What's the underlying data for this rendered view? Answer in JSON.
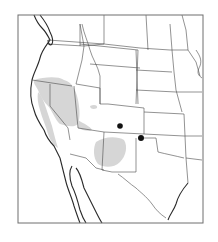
{
  "map": {
    "type": "range-map",
    "region": "western-united-states",
    "colors": {
      "background": "#ffffff",
      "frame": "#6e6e6e",
      "coastline": "#2a2a2a",
      "state_borders": "#4a4a4a",
      "range_fill": "#d6d6d6",
      "point_marker": "#111111"
    },
    "frame": {
      "x": 18,
      "y": 15,
      "width": 185,
      "height": 208
    },
    "range_areas": [
      {
        "name": "great-basin-california-range",
        "path": "M34,80 C44,77 58,76 64,80 C72,82 76,90 78,100 C80,110 80,118 78,124 C74,128 66,126 60,124 C55,120 52,110 48,106 C44,102 40,96 38,90 C36,86 33,83 34,80 Z"
      },
      {
        "name": "utah-nevada-range-tail",
        "path": "M78,120 C84,124 90,126 92,130 C88,132 82,130 78,128 Z"
      },
      {
        "name": "utah-patch",
        "path": "M90,106 C94,104 98,105 97,108 C94,110 90,109 90,106 Z"
      },
      {
        "name": "arizona-new-mexico-range",
        "path": "M96,142 C104,136 118,136 124,140 C128,146 126,156 120,162 C114,168 104,168 98,164 C93,158 93,148 96,142 Z"
      },
      {
        "name": "california-coast-range",
        "path": "M38,92 C42,96 44,102 46,108 C48,114 50,120 52,126 C54,134 56,142 58,148 C54,146 50,140 48,134 C46,126 42,118 40,110 C38,104 37,98 38,92 Z"
      }
    ],
    "point_records": [
      {
        "name": "colorado-record",
        "x": 120,
        "y": 126,
        "r": 2.8
      },
      {
        "name": "oklahoma-panhandle-record",
        "x": 141,
        "y": 138,
        "r": 3
      }
    ],
    "coastlines": [
      {
        "name": "pacific-coast",
        "path": "M34,15 C36,20 38,24 42,28 C46,32 48,36 50,40 C46,46 42,50 40,58 C38,66 34,72 32,80 C30,90 30,100 34,110 C36,118 40,124 44,130 C46,136 50,142 54,146 C56,150 58,154 60,158"
      },
      {
        "name": "puget-sound",
        "path": "M40,15 C44,20 48,26 50,32 C52,36 54,40 52,44 C50,46 48,44 48,40"
      },
      {
        "name": "baja-outer-coast",
        "path": "M60,158 C62,166 64,174 66,182 C68,190 72,198 74,206 C76,212 78,218 80,223"
      },
      {
        "name": "baja-gulf-coast",
        "path": "M72,166 C68,172 70,180 72,186 C76,194 78,202 80,210 C82,216 84,220 86,223"
      },
      {
        "name": "mainland-gulf-coast",
        "path": "M76,168 C80,172 82,180 84,188 C88,196 92,204 96,212 C98,216 100,220 102,223"
      },
      {
        "name": "texas-gulf-coast",
        "path": "M188,183 C182,190 178,196 176,204 C174,210 170,214 168,220"
      }
    ],
    "state_borders": [
      {
        "name": "washington-oregon",
        "path": "M48,44 L84,46 L104,44"
      },
      {
        "name": "oregon-california-nevada",
        "path": "M32,80 L72,86"
      },
      {
        "name": "california-nevada",
        "path": "M50,84 L50,106 L68,128 L70,140"
      },
      {
        "name": "nevada-utah",
        "path": "M74,86 L78,128"
      },
      {
        "name": "idaho-west",
        "path": "M80,24 L84,46 L82,60 L76,84"
      },
      {
        "name": "idaho-montana",
        "path": "M82,24 C84,34 88,42 90,50 C92,58 98,66 100,76"
      },
      {
        "name": "montana-north",
        "path": "M80,44 L138,50"
      },
      {
        "name": "montana-wyoming",
        "path": "M90,64 L140,68"
      },
      {
        "name": "idaho-utah-wyoming",
        "path": "M76,84 L100,88 L100,104"
      },
      {
        "name": "wyoming-east",
        "path": "M138,50 L136,104"
      },
      {
        "name": "wyoming-colorado-utah",
        "path": "M100,76 L100,104 L108,104 L144,108"
      },
      {
        "name": "utah-arizona",
        "path": "M78,128 L104,132 L144,134"
      },
      {
        "name": "colorado-east",
        "path": "M144,108 L144,134"
      },
      {
        "name": "arizona-new-mexico",
        "path": "M104,132 L102,170"
      },
      {
        "name": "new-mexico-texas",
        "path": "M102,170 L112,172 L136,172 L136,138"
      },
      {
        "name": "mexico-border-west",
        "path": "M70,154 L86,158 L96,168 L104,170"
      },
      {
        "name": "texas-mexico-border",
        "path": "M118,174 C124,178 130,184 136,188 C140,192 146,196 152,204 C156,210 160,214 166,218"
      },
      {
        "name": "dakotas-west",
        "path": "M136,50 L138,104"
      },
      {
        "name": "north-south-dakota",
        "path": "M136,70 L172,72"
      },
      {
        "name": "south-dakota-nebraska",
        "path": "M136,90 L176,92"
      },
      {
        "name": "nebraska-kansas",
        "path": "M144,112 L184,114"
      },
      {
        "name": "kansas-oklahoma",
        "path": "M144,134 L184,136"
      },
      {
        "name": "oklahoma-texas",
        "path": "M144,138 L156,138 L158,152 C166,154 176,156 184,158"
      },
      {
        "name": "dakotas-minnesota",
        "path": "M170,24 L172,50 L174,72 L176,90 L182,112"
      },
      {
        "name": "minnesota-east",
        "path": "M188,50 L196,62 L200,76"
      },
      {
        "name": "iowa-missouri",
        "path": "M176,92 L202,92"
      },
      {
        "name": "missouri-arkansas",
        "path": "M184,136 L202,136"
      },
      {
        "name": "arkansas-louisiana",
        "path": "M186,158 L202,160"
      },
      {
        "name": "louisiana-texas",
        "path": "M186,158 L188,183"
      },
      {
        "name": "oklahoma-arkansas",
        "path": "M184,114 L186,158"
      },
      {
        "name": "canada-border",
        "path": "M48,40 L104,44 L140,48 L170,50 L188,50"
      },
      {
        "name": "washington-east",
        "path": "M80,24 L80,46"
      },
      {
        "name": "montana-north-border-canada-inner",
        "path": "M104,15 L104,44"
      },
      {
        "name": "north-dakota-minnesota-border",
        "path": "M146,15 L148,50"
      },
      {
        "name": "minnesota-wisconsin",
        "path": "M182,15 L186,30 L188,50"
      },
      {
        "name": "great-lakes-edge",
        "path": "M196,50 C200,56 202,60 200,66 C198,70 196,74 202,78"
      }
    ]
  }
}
